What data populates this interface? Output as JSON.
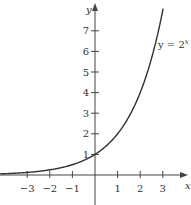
{
  "chart_data": {
    "type": "line",
    "title": "",
    "xlabel": "x",
    "ylabel": "y",
    "xlim": [
      -4,
      4
    ],
    "ylim": [
      0,
      8
    ],
    "grid": false,
    "x_ticks": [
      -3,
      -2,
      -1,
      1,
      2,
      3
    ],
    "y_ticks": [
      1,
      2,
      3,
      4,
      5,
      6,
      7
    ],
    "series": [
      {
        "name": "y = 2^x",
        "function": "2^x",
        "x": [
          -4,
          -3,
          -2,
          -1,
          0,
          1,
          2,
          3
        ],
        "values": [
          0.0625,
          0.125,
          0.25,
          0.5,
          1,
          2,
          4,
          8
        ]
      }
    ],
    "annotations": [
      {
        "text": "y = 2",
        "superscript": "x",
        "position": "upper-right near curve"
      }
    ]
  },
  "labels": {
    "x_axis": "x",
    "y_axis": "y",
    "curve_label_base": "y = 2",
    "curve_label_exp": "x"
  },
  "colors": {
    "curve": "#333333",
    "axes": "#444444",
    "background": "#ffffff"
  }
}
